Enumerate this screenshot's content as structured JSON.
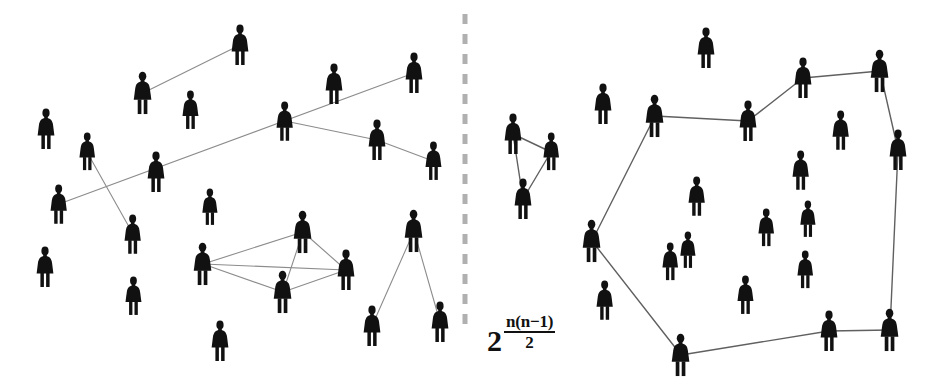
{
  "figure": {
    "width": 949,
    "height": 389,
    "background_color": "#ffffff",
    "person_color": "#111111",
    "edge_color": "#8c8c8c",
    "edge_color_right": "#606060",
    "divider_color": "#b0b0b0"
  },
  "formula": {
    "base": "2",
    "numerator": "n(n−1)",
    "denominator": "2",
    "full_text": "2^(n(n-1)/2)"
  },
  "divider": {
    "name": "dashed-vertical-divider",
    "x": 465,
    "y_start": 14,
    "y_end": 330,
    "dash": "10 10",
    "width": 5
  },
  "left_panel": {
    "name": "left-network-panel",
    "label": "sparse scattered people with few random links",
    "people": [
      {
        "id": "L1",
        "x": 46,
        "y": 129,
        "s": 1.0
      },
      {
        "id": "L2",
        "x": 87,
        "y": 152,
        "s": 0.93
      },
      {
        "id": "L3",
        "x": 143,
        "y": 93,
        "s": 1.05
      },
      {
        "id": "L4",
        "x": 190,
        "y": 110,
        "s": 0.95
      },
      {
        "id": "L5",
        "x": 240,
        "y": 45,
        "s": 1.0
      },
      {
        "id": "L6",
        "x": 285,
        "y": 121,
        "s": 0.97
      },
      {
        "id": "L7",
        "x": 334,
        "y": 84,
        "s": 1.0
      },
      {
        "id": "L8",
        "x": 377,
        "y": 140,
        "s": 1.0
      },
      {
        "id": "L9",
        "x": 414,
        "y": 73,
        "s": 1.0
      },
      {
        "id": "L10",
        "x": 433,
        "y": 161,
        "s": 0.95
      },
      {
        "id": "L11",
        "x": 156,
        "y": 172,
        "s": 1.0
      },
      {
        "id": "L12",
        "x": 59,
        "y": 204,
        "s": 0.97
      },
      {
        "id": "L13",
        "x": 133,
        "y": 234,
        "s": 0.97
      },
      {
        "id": "L14",
        "x": 45,
        "y": 267,
        "s": 1.0
      },
      {
        "id": "L15",
        "x": 133,
        "y": 296,
        "s": 0.95
      },
      {
        "id": "L16",
        "x": 220,
        "y": 341,
        "s": 1.0
      },
      {
        "id": "L17",
        "x": 203,
        "y": 264,
        "s": 1.05
      },
      {
        "id": "L18",
        "x": 303,
        "y": 232,
        "s": 1.05
      },
      {
        "id": "L19",
        "x": 346,
        "y": 270,
        "s": 1.0
      },
      {
        "id": "L20",
        "x": 283,
        "y": 292,
        "s": 1.05
      },
      {
        "id": "L21",
        "x": 210,
        "y": 207,
        "s": 0.9
      },
      {
        "id": "L22",
        "x": 414,
        "y": 231,
        "s": 1.05
      },
      {
        "id": "L23",
        "x": 372,
        "y": 326,
        "s": 1.0
      },
      {
        "id": "L24",
        "x": 440,
        "y": 322,
        "s": 1.0
      }
    ],
    "edges": [
      {
        "from": "L5",
        "to": "L3"
      },
      {
        "from": "L9",
        "to": "L12"
      },
      {
        "from": "L2",
        "to": "L13"
      },
      {
        "from": "L8",
        "to": "L6"
      },
      {
        "from": "L8",
        "to": "L10"
      },
      {
        "from": "L17",
        "to": "L18"
      },
      {
        "from": "L17",
        "to": "L19"
      },
      {
        "from": "L17",
        "to": "L20"
      },
      {
        "from": "L18",
        "to": "L19"
      },
      {
        "from": "L18",
        "to": "L20"
      },
      {
        "from": "L19",
        "to": "L20"
      },
      {
        "from": "L22",
        "to": "L23"
      },
      {
        "from": "L22",
        "to": "L24"
      }
    ]
  },
  "right_panel": {
    "name": "right-network-panel",
    "label": "people joined into a connected cycle plus a triangle",
    "people": [
      {
        "id": "R1",
        "x": 513,
        "y": 134,
        "s": 1.0
      },
      {
        "id": "R2",
        "x": 551,
        "y": 152,
        "s": 0.93
      },
      {
        "id": "R3",
        "x": 523,
        "y": 199,
        "s": 1.0
      },
      {
        "id": "R4",
        "x": 603,
        "y": 104,
        "s": 1.0
      },
      {
        "id": "R5",
        "x": 655,
        "y": 116,
        "s": 1.05
      },
      {
        "id": "R6",
        "x": 592,
        "y": 241,
        "s": 1.05
      },
      {
        "id": "R7",
        "x": 605,
        "y": 300,
        "s": 0.97
      },
      {
        "id": "R8",
        "x": 681,
        "y": 355,
        "s": 1.05
      },
      {
        "id": "R9",
        "x": 748,
        "y": 121,
        "s": 1.0
      },
      {
        "id": "R10",
        "x": 706,
        "y": 48,
        "s": 1.0
      },
      {
        "id": "R11",
        "x": 803,
        "y": 78,
        "s": 1.0
      },
      {
        "id": "R12",
        "x": 880,
        "y": 71,
        "s": 1.05
      },
      {
        "id": "R13",
        "x": 898,
        "y": 150,
        "s": 1.0
      },
      {
        "id": "R14",
        "x": 890,
        "y": 330,
        "s": 1.05
      },
      {
        "id": "R15",
        "x": 829,
        "y": 331,
        "s": 1.0
      },
      {
        "id": "R16",
        "x": 841,
        "y": 130,
        "s": 0.97
      },
      {
        "id": "R17",
        "x": 801,
        "y": 170,
        "s": 0.97
      },
      {
        "id": "R18",
        "x": 697,
        "y": 196,
        "s": 0.97
      },
      {
        "id": "R19",
        "x": 670,
        "y": 262,
        "s": 0.93
      },
      {
        "id": "R20",
        "x": 745,
        "y": 295,
        "s": 0.95
      },
      {
        "id": "R21",
        "x": 805,
        "y": 270,
        "s": 0.93
      },
      {
        "id": "R22",
        "x": 766,
        "y": 228,
        "s": 0.93
      },
      {
        "id": "R23",
        "x": 808,
        "y": 219,
        "s": 0.9
      },
      {
        "id": "R24",
        "x": 688,
        "y": 250,
        "s": 0.9
      }
    ],
    "edges": [
      {
        "from": "R1",
        "to": "R2"
      },
      {
        "from": "R1",
        "to": "R3"
      },
      {
        "from": "R2",
        "to": "R3"
      },
      {
        "from": "R5",
        "to": "R6"
      },
      {
        "from": "R5",
        "to": "R9"
      },
      {
        "from": "R9",
        "to": "R11"
      },
      {
        "from": "R11",
        "to": "R12"
      },
      {
        "from": "R12",
        "to": "R13"
      },
      {
        "from": "R13",
        "to": "R14"
      },
      {
        "from": "R14",
        "to": "R15"
      },
      {
        "from": "R15",
        "to": "R8"
      },
      {
        "from": "R8",
        "to": "R6"
      }
    ]
  }
}
